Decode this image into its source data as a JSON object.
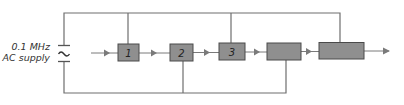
{
  "source": {
    "label_line1": "0.1 MHz",
    "label_line2": "AC supply",
    "symbol": "~"
  },
  "blocks": [
    {
      "id": "block-1",
      "label": "1"
    },
    {
      "id": "block-2",
      "label": "2"
    },
    {
      "id": "block-3",
      "label": "3"
    },
    {
      "id": "block-4",
      "label": ""
    },
    {
      "id": "block-5",
      "label": ""
    }
  ],
  "colors": {
    "line": "#6e6e6e",
    "block_fill": "#8f8f8f",
    "block_stroke": "#4a4a4a",
    "arrow": "#7a7a7a"
  }
}
